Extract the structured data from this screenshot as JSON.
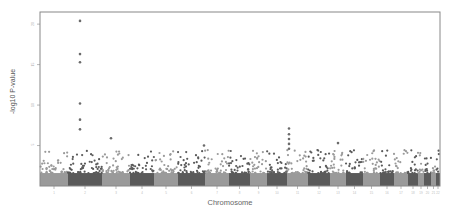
{
  "chart_data": {
    "type": "scatter",
    "subtype": "manhattan",
    "title": "",
    "xlabel": "Chromosome",
    "ylabel": "-log10 P-value",
    "ylim": [
      0,
      21.5
    ],
    "yticks": [
      5,
      10,
      15,
      20
    ],
    "grid": false,
    "legend": null,
    "colors": [
      "#9a9a9a",
      "#5a5a5a"
    ],
    "point_color": "#6b6b6b",
    "baseline_band_max": 1.6,
    "background_scatter_max": 4.5,
    "categories": [
      "1",
      "2",
      "3",
      "4",
      "5",
      "6",
      "7",
      "8",
      "9",
      "10",
      "11",
      "12",
      "13",
      "14",
      "15",
      "16",
      "17",
      "18",
      "19",
      "20",
      "21",
      "22"
    ],
    "chromosome_bounds_px": [
      [
        40,
        68
      ],
      [
        68,
        102
      ],
      [
        102,
        130
      ],
      [
        130,
        154
      ],
      [
        154,
        178
      ],
      [
        178,
        205
      ],
      [
        205,
        229
      ],
      [
        229,
        250
      ],
      [
        250,
        267
      ],
      [
        267,
        287
      ],
      [
        287,
        308
      ],
      [
        308,
        330
      ],
      [
        330,
        346
      ],
      [
        346,
        363
      ],
      [
        363,
        380
      ],
      [
        380,
        394
      ],
      [
        394,
        408
      ],
      [
        408,
        418
      ],
      [
        418,
        424
      ],
      [
        424,
        431
      ],
      [
        431,
        436
      ],
      [
        436,
        440
      ]
    ],
    "notable_points": [
      {
        "chromosome": "2",
        "x_px": 80,
        "y": 20.4
      },
      {
        "chromosome": "2",
        "x_px": 80,
        "y": 16.3
      },
      {
        "chromosome": "2",
        "x_px": 80,
        "y": 15.3
      },
      {
        "chromosome": "2",
        "x_px": 80,
        "y": 10.2
      },
      {
        "chromosome": "2",
        "x_px": 80,
        "y": 8.2
      },
      {
        "chromosome": "2",
        "x_px": 80,
        "y": 7.0
      },
      {
        "chromosome": "3",
        "x_px": 111,
        "y": 5.9
      },
      {
        "chromosome": "10",
        "x_px": 289,
        "y": 7.1
      },
      {
        "chromosome": "10",
        "x_px": 289,
        "y": 6.4
      },
      {
        "chromosome": "10",
        "x_px": 289,
        "y": 5.8
      },
      {
        "chromosome": "10",
        "x_px": 289,
        "y": 5.2
      },
      {
        "chromosome": "10",
        "x_px": 289,
        "y": 4.6
      },
      {
        "chromosome": "6",
        "x_px": 204,
        "y": 5.0
      },
      {
        "chromosome": "12",
        "x_px": 338,
        "y": 5.3
      }
    ]
  }
}
